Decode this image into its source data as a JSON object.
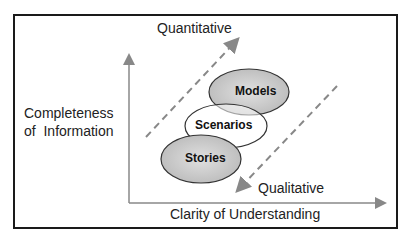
{
  "diagram": {
    "top_label": "Quantitative",
    "bottom_label": "Qualitative",
    "y_axis_label_line1": "Completeness",
    "y_axis_label_line2": "of  Information",
    "x_axis_label": "Clarity of Understanding",
    "nodes": [
      {
        "label": "Models",
        "fill": "#c8c8c8"
      },
      {
        "label": "Scenarios",
        "fill": "#ffffff"
      },
      {
        "label": "Stories",
        "fill": "#c8c8c8"
      }
    ],
    "colors": {
      "frame": "#1a1a1a",
      "axis": "#888888",
      "dashed": "#888888"
    }
  }
}
